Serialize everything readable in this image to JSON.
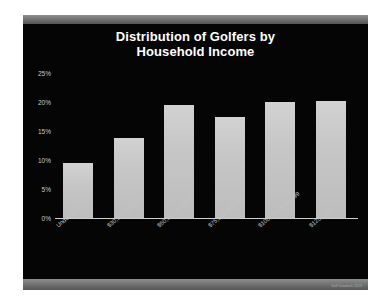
{
  "slide": {
    "background_color": "#050505",
    "frame_color": "#6e6e6e",
    "watermark": "Golf Datatech 2023"
  },
  "chart_data": {
    "type": "bar",
    "title": "Distribution of Golfers by Household Income",
    "title_line1": "Distribution of Golfers by",
    "title_line2": "Household Income",
    "xlabel": "",
    "ylabel": "",
    "ylim": [
      0,
      25
    ],
    "grid": false,
    "legend": null,
    "bar_color": "#c8c8c8",
    "categories": [
      "Under $30,000",
      "$30,000-$49,999",
      "$50,000-$74,999",
      "$75,000-$99,999",
      "$100,000-$124,999",
      "$125,000+"
    ],
    "values": [
      9.5,
      13.8,
      19.5,
      17.5,
      20.0,
      20.2
    ],
    "ytick_labels": [
      "0%",
      "5%",
      "10%",
      "15%",
      "20%",
      "25%"
    ],
    "ytick_values": [
      0,
      5,
      10,
      15,
      20,
      25
    ]
  }
}
